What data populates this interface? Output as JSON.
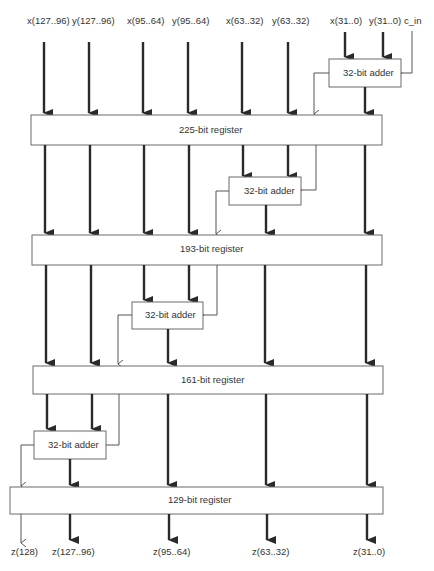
{
  "diagram": {
    "type": "pipelined carry-select adder block diagram",
    "inputs": [
      {
        "id": "x127_96",
        "label": "x(127..96)"
      },
      {
        "id": "y127_96",
        "label": "y(127..96)"
      },
      {
        "id": "x95_64",
        "label": "x(95..64)"
      },
      {
        "id": "y95_64",
        "label": "y(95..64)"
      },
      {
        "id": "x63_32",
        "label": "x(63..32)"
      },
      {
        "id": "y63_32",
        "label": "y(63..32)"
      },
      {
        "id": "x31_0",
        "label": "x(31..0)"
      },
      {
        "id": "y31_0",
        "label": "y(31..0)"
      },
      {
        "id": "c_in",
        "label": "c_in"
      }
    ],
    "adders": [
      {
        "id": "adder0",
        "label": "32-bit adder"
      },
      {
        "id": "adder1",
        "label": "32-bit adder"
      },
      {
        "id": "adder2",
        "label": "32-bit adder"
      },
      {
        "id": "adder3",
        "label": "32-bit adder"
      }
    ],
    "registers": [
      {
        "id": "reg225",
        "label": "225-bit register"
      },
      {
        "id": "reg193",
        "label": "193-bit register"
      },
      {
        "id": "reg161",
        "label": "161-bit register"
      },
      {
        "id": "reg129",
        "label": "129-bit register"
      }
    ],
    "outputs": [
      {
        "id": "z128",
        "label": "z(128)"
      },
      {
        "id": "z127_96",
        "label": "z(127..96)"
      },
      {
        "id": "z95_64",
        "label": "z(95..64)"
      },
      {
        "id": "z63_32",
        "label": "z(63..32)"
      },
      {
        "id": "z31_0",
        "label": "z(31..0)"
      }
    ]
  },
  "colors": {
    "line": "#2a2a2a",
    "box_border": "#6b6b6b",
    "text": "#333333",
    "background": "#ffffff"
  }
}
